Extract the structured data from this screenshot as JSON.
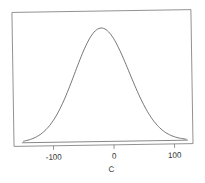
{
  "chart_data": {
    "type": "line",
    "title": "",
    "xlabel": "C",
    "ylabel": "",
    "xlim": [
      -165,
      130
    ],
    "x_ticks": [
      -100,
      0,
      100
    ],
    "x_tick_labels": [
      "-100",
      "0",
      "100"
    ],
    "y_ticks": [],
    "grid": false,
    "legend": null,
    "series": [
      {
        "name": "density",
        "distribution": "normal",
        "mean": -18,
        "sd": 45,
        "x": [
          -150,
          -140,
          -130,
          -120,
          -110,
          -100,
          -90,
          -80,
          -70,
          -60,
          -50,
          -40,
          -30,
          -20,
          -18,
          -10,
          0,
          10,
          20,
          30,
          40,
          50,
          60,
          70,
          80,
          90,
          100,
          110,
          120
        ],
        "y_relative": [
          0.014,
          0.024,
          0.045,
          0.076,
          0.124,
          0.19,
          0.279,
          0.388,
          0.507,
          0.635,
          0.757,
          0.864,
          0.945,
          0.999,
          1.0,
          0.985,
          0.923,
          0.826,
          0.7,
          0.566,
          0.434,
          0.317,
          0.22,
          0.146,
          0.092,
          0.054,
          0.032,
          0.017,
          0.009
        ]
      }
    ],
    "colors": {
      "line": "#555555",
      "frame": "#777777",
      "text": "#333333"
    }
  }
}
